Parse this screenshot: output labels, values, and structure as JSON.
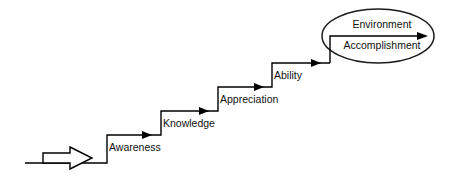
{
  "diagram": {
    "type": "staircase-progression",
    "title": "",
    "entry_arrow": {
      "icon": "block-arrow-right",
      "label": ""
    },
    "steps": [
      {
        "label": "Awareness",
        "order": 1
      },
      {
        "label": "Knowledge",
        "order": 2
      },
      {
        "label": "Appreciation",
        "order": 3
      },
      {
        "label": "Ability",
        "order": 4
      }
    ],
    "outcome": {
      "shape": "ellipse",
      "labels": [
        {
          "label": "Environment"
        },
        {
          "label": "Accomplishment"
        }
      ]
    },
    "colors": {
      "stroke": "#000000",
      "text": "#111111",
      "background": "#ffffff"
    }
  }
}
